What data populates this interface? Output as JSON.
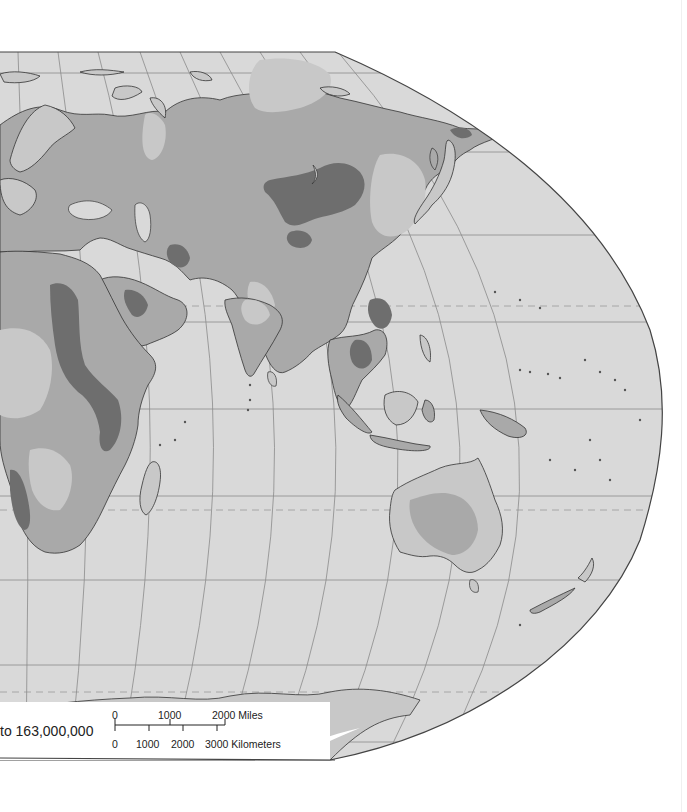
{
  "map": {
    "projection": "world map fragment (Eastern Hemisphere)",
    "colors": {
      "ocean": "#d9d9d9",
      "land_light": "#c8c8c8",
      "land_mid": "#a9a9a9",
      "land_dark": "#6e6e6e",
      "land_pale": "#d4d4d4",
      "ice": "#ffffff",
      "coast": "#333333",
      "grid": "#8a8a8a",
      "frame": "#444444"
    },
    "regions": [
      "Europe",
      "Asia",
      "Africa",
      "Arabian Peninsula",
      "India",
      "Southeast Asia",
      "Indonesia",
      "Australia",
      "New Zealand",
      "Antarctica",
      "Madagascar",
      "Japan"
    ]
  },
  "scale": {
    "ratio_text": "to 163,000,000",
    "miles": {
      "ticks": [
        "0",
        "1000",
        "2000 Miles"
      ]
    },
    "kilometers": {
      "ticks": [
        "0",
        "1000",
        "2000",
        "3000 Kilometers"
      ]
    }
  }
}
